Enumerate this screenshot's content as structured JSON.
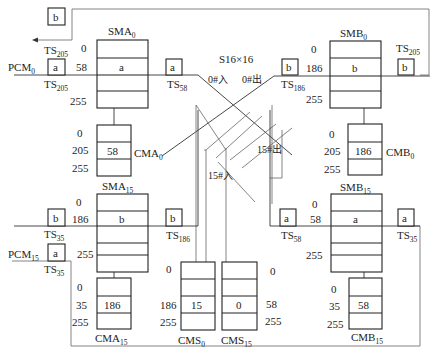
{
  "diagram": {
    "title": "S16×16",
    "switch": {
      "label": "S16×16",
      "in0": "0#入",
      "out0": "0#出",
      "in15": "15#入",
      "out15": "15#出"
    },
    "pcm_labels": {
      "pcm0": {
        "base": "PCM",
        "sub": "0"
      },
      "pcm15": {
        "base": "PCM",
        "sub": "15"
      }
    },
    "memories": {
      "SMA0": {
        "base": "SMA",
        "sub": "0",
        "rows": [
          "0",
          "58",
          "255"
        ],
        "cell": "a"
      },
      "SMB0": {
        "base": "SMB",
        "sub": "0",
        "rows": [
          "0",
          "186",
          "255"
        ],
        "cell": "b"
      },
      "SMA15": {
        "base": "SMA",
        "sub": "15",
        "rows": [
          "0",
          "186",
          "255"
        ],
        "cell": "b"
      },
      "SMB15": {
        "base": "SMB",
        "sub": "15",
        "rows": [
          "0",
          "58",
          "255"
        ],
        "cell": "a"
      },
      "CMA0": {
        "base": "CMA",
        "sub": "0",
        "rows": [
          "0",
          "205",
          "255"
        ],
        "cell": "58"
      },
      "CMB0": {
        "base": "CMB",
        "sub": "0",
        "rows": [
          "0",
          "205",
          "255"
        ],
        "cell": "186"
      },
      "CMA15": {
        "base": "CMA",
        "sub": "15",
        "rows": [
          "0",
          "35",
          "255"
        ],
        "cell": "186"
      },
      "CMB15": {
        "base": "CMB",
        "sub": "15",
        "rows": [
          "0",
          "35",
          "255"
        ],
        "cell": "58"
      },
      "CMS0": {
        "base": "CMS",
        "sub": "0",
        "rows": [
          "0",
          "186",
          "255"
        ],
        "cell": "15"
      },
      "CMS15": {
        "base": "CMS",
        "sub": "15",
        "rows": [
          "0",
          "58",
          "255"
        ],
        "cell": "0"
      }
    },
    "timeslots": {
      "ts205_top_out": {
        "box": "b",
        "base": "TS",
        "sub": "205"
      },
      "ts205_in": {
        "box": "a",
        "base": "TS",
        "sub": "205"
      },
      "ts58_a0": {
        "box": "a",
        "base": "TS",
        "sub": "58"
      },
      "ts186_b0_in": {
        "box": "b",
        "base": "TS",
        "sub": "186"
      },
      "ts205_b0_out": {
        "box": "b",
        "base": "TS",
        "sub": "205"
      },
      "ts35_out": {
        "box": "b",
        "base": "TS",
        "sub": "35"
      },
      "ts35_in": {
        "box": "a",
        "base": "TS",
        "sub": "35"
      },
      "ts186_a15": {
        "box": "b",
        "base": "TS",
        "sub": "186"
      },
      "ts58_b15_in": {
        "box": "a",
        "base": "TS",
        "sub": "58"
      },
      "ts35_b15_out": {
        "box": "a",
        "base": "TS",
        "sub": "35"
      }
    }
  }
}
